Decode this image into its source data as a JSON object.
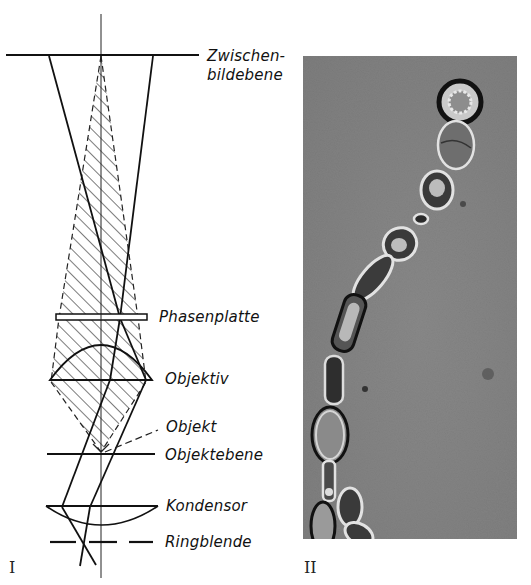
{
  "figure": {
    "panel_1": {
      "label": "I",
      "labels": {
        "intermediate_image_plane": [
          "Zwischen-",
          "bildebene"
        ],
        "phase_plate": "Phasenplatte",
        "objective": "Objektiv",
        "object": "Objekt",
        "object_plane": "Objektebene",
        "condenser": "Kondensor",
        "annular_diaphragm": "Ringblende"
      }
    },
    "panel_2": {
      "label": "II",
      "description": "Phase-contrast micrograph of a chain of yeast-like cells"
    }
  }
}
